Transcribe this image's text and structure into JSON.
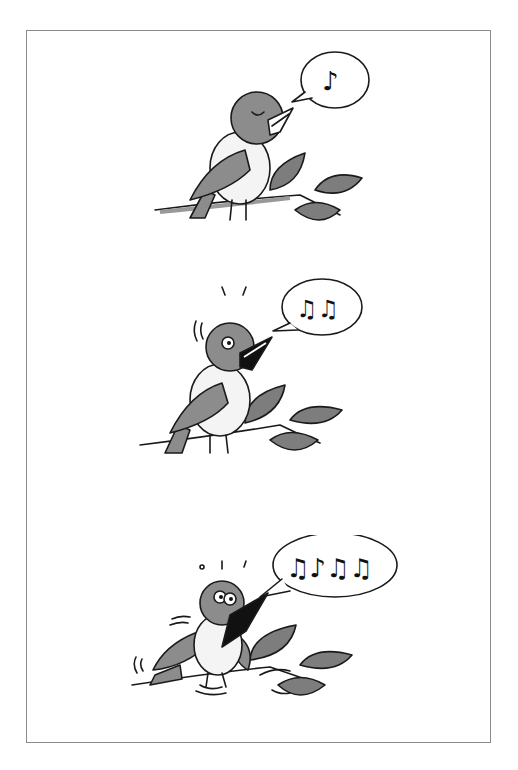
{
  "illustration": {
    "description": "Three-panel cartoon of a bird singing on a branch with increasing enthusiasm",
    "panels": [
      {
        "id": 1,
        "mood": "calm, eyes closed",
        "notes": 1,
        "note_glyph": "♪"
      },
      {
        "id": 2,
        "mood": "excited, eyes open, motion lines",
        "notes": 2,
        "note_glyph": "♫♫"
      },
      {
        "id": 3,
        "mood": "ecstatic, shaking, wings spread",
        "notes": 4,
        "note_glyph": "♫♪♫♫"
      }
    ],
    "colors": {
      "ink": "#1a1a1a",
      "bird_gray": "#8c8c8c",
      "leaf_gray": "#7d7d7d",
      "frame_border": "#8a8a8a",
      "background": "#ffffff"
    }
  }
}
